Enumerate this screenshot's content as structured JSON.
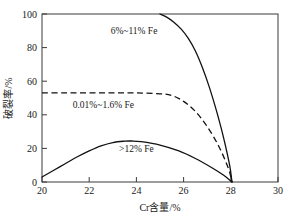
{
  "chart_data": {
    "type": "line",
    "title": "",
    "xlabel": "Cr含量/%",
    "ylabel": "破裂率/%",
    "xlim": [
      20,
      30
    ],
    "ylim": [
      0,
      100
    ],
    "xticks": [
      "20",
      "22",
      "24",
      "26",
      "28",
      "30"
    ],
    "yticks": [
      "0",
      "20",
      "40",
      "60",
      "80",
      "100"
    ],
    "grid": false,
    "legend": "none",
    "series": [
      {
        "name": "6%~11% Fe",
        "style": "solid",
        "x": [
          25.0,
          25.3,
          25.6,
          25.9,
          26.2,
          26.5,
          26.8,
          27.1,
          27.4,
          27.7,
          27.95,
          28.05
        ],
        "y": [
          100,
          98,
          95,
          91,
          85.5,
          78,
          68,
          56,
          42,
          26,
          10,
          0
        ]
      },
      {
        "name": "0.01%~1.6% Fe",
        "style": "dashed",
        "x": [
          20.0,
          21.0,
          22.0,
          23.0,
          24.0,
          25.0,
          25.5,
          26.0,
          26.5,
          27.0,
          27.5,
          27.9,
          28.05
        ],
        "y": [
          53,
          53,
          53,
          53,
          53,
          52.5,
          51.5,
          48,
          42,
          33,
          21,
          8,
          0
        ]
      },
      {
        "name": ">12% Fe",
        "style": "solid",
        "x": [
          20.0,
          20.5,
          21.0,
          21.5,
          22.0,
          22.5,
          23.0,
          23.5,
          23.8,
          24.2,
          25.0,
          25.8,
          26.5,
          27.2,
          27.7,
          28.05
        ],
        "y": [
          3,
          7,
          11,
          15,
          18.5,
          21.5,
          23.5,
          24.3,
          24.4,
          24.0,
          22.0,
          18.5,
          14.0,
          8.5,
          4.0,
          0
        ]
      }
    ],
    "annotations": [
      {
        "text": "6%~11% Fe",
        "x": 23.9,
        "y": 88
      },
      {
        "text": "0.01%~1.6% Fe",
        "x": 22.6,
        "y": 44
      },
      {
        "text": ">12% Fe",
        "x": 24.0,
        "y": 18
      }
    ],
    "colors": {
      "curve": "#111111",
      "frame": "#3a3a3a",
      "background": "#ffffff"
    }
  }
}
